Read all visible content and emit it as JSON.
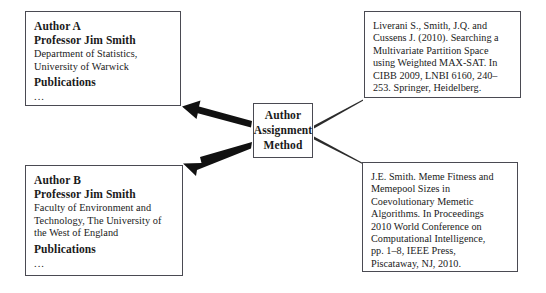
{
  "figure": {
    "type": "flow-diagram",
    "background_color": "#ffffff",
    "border_color": "#4a4a52",
    "arrow_color": "#111111"
  },
  "author_a": {
    "title": "Author A",
    "name": "Professor Jim Smith",
    "affiliation_lines": [
      "Department of Statistics,",
      "University of Warwick"
    ],
    "publications_heading": "Publications",
    "publications_ellipsis": "..."
  },
  "author_b": {
    "title": "Author B",
    "name": "Professor Jim Smith",
    "affiliation_lines": [
      "Faculty of Environment and",
      "Technology, The University of",
      "the West of England"
    ],
    "publications_heading": "Publications",
    "publications_ellipsis": "..."
  },
  "method": {
    "line1": "Author",
    "line2": "Assignment",
    "line3": "Method"
  },
  "citation_top": {
    "lines": [
      "Liverani S., Smith, J.Q. and",
      "Cussens J. (2010). Searching a",
      "Multivariate Partition Space",
      "using Weighted MAX-SAT. In",
      "CIBB 2009, LNBI 6160, 240–",
      "253. Springer, Heidelberg."
    ]
  },
  "citation_bottom": {
    "lines": [
      "J.E. Smith. Meme Fitness and",
      "Memepool Sizes in",
      "Coevolutionary Memetic",
      "Algorithms. In Proceedings",
      "2010 World Conference on",
      "Computational Intelligence,",
      "pp. 1–8, IEEE Press,",
      "Piscataway, NJ, 2010."
    ]
  }
}
